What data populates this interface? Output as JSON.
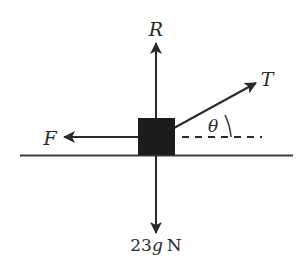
{
  "diagram": {
    "colors": {
      "ink": "#2a2a2a",
      "block": "#1c1c1c",
      "background": "#ffffff"
    },
    "forces": {
      "normal": {
        "label": "R",
        "direction": "up"
      },
      "tension": {
        "label": "T",
        "direction": "up-right",
        "angle_symbol": "θ"
      },
      "friction": {
        "label": "F",
        "direction": "left"
      },
      "weight": {
        "label_number": "23",
        "label_symbol": "g",
        "label_unit": "N",
        "direction": "down"
      }
    }
  }
}
